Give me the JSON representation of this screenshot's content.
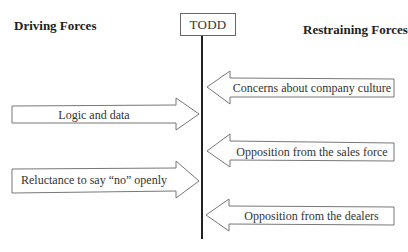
{
  "diagram": {
    "type": "force-field-analysis",
    "center_label": "TODD",
    "headings": {
      "driving": "Driving Forces",
      "restraining": "Restraining Forces"
    },
    "driving_forces": [
      {
        "label": "Logic and data",
        "direction": "right"
      },
      {
        "label": "Reluctance to say “no” openly",
        "direction": "right"
      }
    ],
    "restraining_forces": [
      {
        "label": "Concerns about company culture",
        "direction": "left"
      },
      {
        "label": "Opposition from the sales force",
        "direction": "left"
      },
      {
        "label": "Opposition from the dealers",
        "direction": "left"
      }
    ],
    "colors": {
      "center_line": "#222222",
      "arrow_stroke": "#777777",
      "arrow_fill": "#ffffff",
      "text": "#333333"
    }
  }
}
